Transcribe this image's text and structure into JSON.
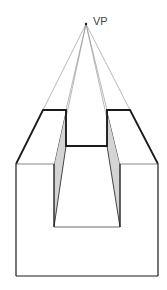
{
  "diagram": {
    "vanishing_point": {
      "label": "VP",
      "x": 86,
      "y": 24
    },
    "colors": {
      "edge": "#1a1a1a",
      "construction_line": "#8a8a8a",
      "shaded_face": "#d4d4d4",
      "background": "#ffffff"
    }
  }
}
